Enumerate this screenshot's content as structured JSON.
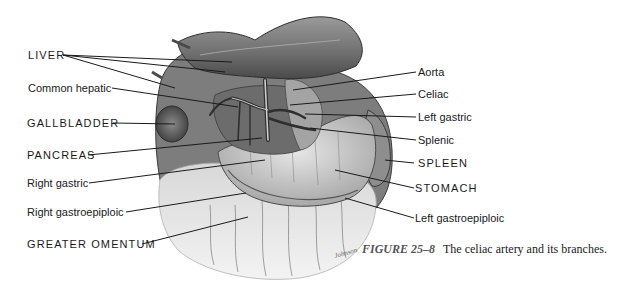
{
  "figure": {
    "number_label": "FIGURE 25–8",
    "caption_text": "The celiac artery and its branches."
  },
  "labels": {
    "left": [
      {
        "id": "liver",
        "text": "LIVER",
        "caps": true
      },
      {
        "id": "common-hepatic",
        "text": "Common hepatic",
        "caps": false
      },
      {
        "id": "gallbladder",
        "text": "GALLBLADDER",
        "caps": true
      },
      {
        "id": "pancreas",
        "text": "PANCREAS",
        "caps": true
      },
      {
        "id": "right-gastric",
        "text": "Right gastric",
        "caps": false
      },
      {
        "id": "right-gastroepiploic",
        "text": "Right gastroepiploic",
        "caps": false
      },
      {
        "id": "greater-omentum",
        "text": "GREATER OMENTUM",
        "caps": true
      }
    ],
    "right": [
      {
        "id": "aorta",
        "text": "Aorta",
        "caps": false
      },
      {
        "id": "celiac",
        "text": "Celiac",
        "caps": false
      },
      {
        "id": "left-gastric",
        "text": "Left gastric",
        "caps": false
      },
      {
        "id": "splenic",
        "text": "Splenic",
        "caps": false
      },
      {
        "id": "spleen",
        "text": "SPLEEN",
        "caps": true
      },
      {
        "id": "stomach",
        "text": "STOMACH",
        "caps": true
      },
      {
        "id": "left-gastroepiploic",
        "text": "Left gastroepiploic",
        "caps": false
      }
    ]
  },
  "signature": "Johnson",
  "colors": {
    "ink": "#1a1a1a",
    "organ_dark": "#5a5a5a",
    "organ_mid": "#8c8c8c",
    "organ_light": "#c8c8c8",
    "omentum": "#dcdcdc",
    "caption_fig": "#555555"
  }
}
